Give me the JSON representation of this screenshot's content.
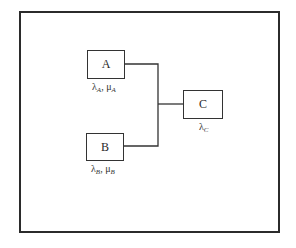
{
  "diagram": {
    "type": "reliability-block-diagram",
    "blocks": [
      {
        "id": "A",
        "label": "A",
        "rate_symbol": "λ",
        "rate_sub": "A",
        "repair_symbol": "μ",
        "repair_sub": "A"
      },
      {
        "id": "B",
        "label": "B",
        "rate_symbol": "λ",
        "rate_sub": "B",
        "repair_symbol": "μ",
        "repair_sub": "B"
      },
      {
        "id": "C",
        "label": "C",
        "rate_symbol": "λ",
        "rate_sub": "C"
      }
    ],
    "separator": ", ",
    "connections": [
      {
        "from": "A",
        "to": "junction"
      },
      {
        "from": "B",
        "to": "junction"
      },
      {
        "from": "junction",
        "to": "C"
      }
    ],
    "colors": {
      "line": "#333333",
      "frame": "#2b2b2b",
      "background": "#ffffff"
    }
  }
}
